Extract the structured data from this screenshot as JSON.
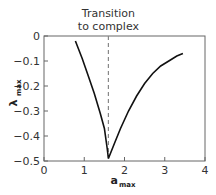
{
  "chart_data": {
    "type": "line",
    "title": "",
    "xlabel": "a_max",
    "ylabel": "λ_max",
    "xlabel_main": "a",
    "xlabel_sub": "max",
    "ylabel_main": "λ",
    "ylabel_sub": "max",
    "xlim": [
      0,
      4
    ],
    "ylim": [
      -0.5,
      0
    ],
    "xticks": [
      "0",
      "1",
      "2",
      "3",
      "4"
    ],
    "yticks": [
      "0",
      "-0.1",
      "-0.2",
      "-0.3",
      "-0.4",
      "-0.5"
    ],
    "grid": false,
    "annotation": {
      "line1": "Transition",
      "line2": "to complex",
      "x": 1.6
    },
    "series": [
      {
        "name": "λmax",
        "x": [
          0.78,
          0.95,
          1.1,
          1.25,
          1.4,
          1.5,
          1.57,
          1.6,
          1.75,
          1.9,
          2.1,
          2.3,
          2.5,
          2.7,
          2.9,
          3.1,
          3.3,
          3.45
        ],
        "y": [
          -0.02,
          -0.09,
          -0.16,
          -0.23,
          -0.31,
          -0.37,
          -0.45,
          -0.49,
          -0.43,
          -0.37,
          -0.3,
          -0.24,
          -0.19,
          -0.15,
          -0.12,
          -0.1,
          -0.08,
          -0.07
        ]
      }
    ]
  }
}
